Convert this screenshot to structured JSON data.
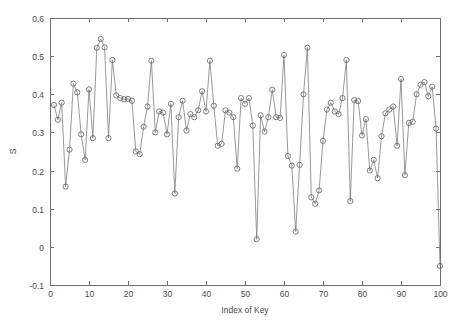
{
  "chart_data": {
    "type": "line",
    "title": "",
    "subtitle": "",
    "xlabel": "Index of Key",
    "ylabel": "S",
    "xlim": [
      0,
      100
    ],
    "ylim": [
      -0.1,
      0.6
    ],
    "xticks": [
      0,
      10,
      20,
      30,
      40,
      50,
      60,
      70,
      80,
      90,
      100
    ],
    "xtick_labels": [
      "0",
      "10",
      "20",
      "30",
      "40",
      "50",
      "60",
      "70",
      "80",
      "90",
      "100"
    ],
    "yticks": [
      -0.1,
      0,
      0.1,
      0.2,
      0.3,
      0.4,
      0.5,
      0.6
    ],
    "ytick_labels": [
      "-0.1",
      "0",
      "0.1",
      "0.2",
      "0.3",
      "0.4",
      "0.5",
      "0.6"
    ],
    "grid": false,
    "legend": null,
    "marker": "circle-open",
    "line_color": "#7d7d7d",
    "marker_color": "#5f5f5f",
    "series": [
      {
        "name": "S",
        "x": [
          1,
          2,
          3,
          4,
          5,
          6,
          7,
          8,
          9,
          10,
          11,
          12,
          13,
          14,
          15,
          16,
          17,
          18,
          19,
          20,
          21,
          22,
          23,
          24,
          25,
          26,
          27,
          28,
          29,
          30,
          31,
          32,
          33,
          34,
          35,
          36,
          37,
          38,
          39,
          40,
          41,
          42,
          43,
          44,
          45,
          46,
          47,
          48,
          49,
          50,
          51,
          52,
          53,
          54,
          55,
          56,
          57,
          58,
          59,
          60,
          61,
          62,
          63,
          64,
          65,
          66,
          67,
          68,
          69,
          70,
          71,
          72,
          73,
          74,
          75,
          76,
          77,
          78,
          79,
          80,
          81,
          82,
          83,
          84,
          85,
          86,
          87,
          88,
          89,
          90,
          91,
          92,
          93,
          94,
          95,
          96,
          97,
          98,
          99,
          100
        ],
        "values": [
          0.372,
          0.333,
          0.378,
          0.158,
          0.255,
          0.428,
          0.405,
          0.295,
          0.228,
          0.413,
          0.285,
          0.522,
          0.545,
          0.523,
          0.285,
          0.49,
          0.397,
          0.39,
          0.387,
          0.388,
          0.383,
          0.25,
          0.243,
          0.315,
          0.368,
          0.488,
          0.3,
          0.355,
          0.352,
          0.295,
          0.375,
          0.14,
          0.34,
          0.383,
          0.305,
          0.348,
          0.34,
          0.358,
          0.408,
          0.355,
          0.488,
          0.37,
          0.265,
          0.27,
          0.358,
          0.352,
          0.34,
          0.205,
          0.39,
          0.375,
          0.39,
          0.318,
          0.02,
          0.345,
          0.302,
          0.34,
          0.412,
          0.34,
          0.338,
          0.503,
          0.238,
          0.213,
          0.04,
          0.215,
          0.4,
          0.522,
          0.13,
          0.113,
          0.148,
          0.278,
          0.36,
          0.378,
          0.355,
          0.348,
          0.39,
          0.49,
          0.12,
          0.385,
          0.382,
          0.292,
          0.335,
          0.2,
          0.228,
          0.18,
          0.29,
          0.35,
          0.36,
          0.368,
          0.265,
          0.44,
          0.188,
          0.325,
          0.328,
          0.4,
          0.425,
          0.432,
          0.395,
          0.42,
          0.31,
          -0.05
        ]
      }
    ]
  }
}
